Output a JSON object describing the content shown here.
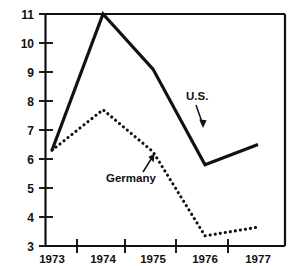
{
  "chart_data": {
    "type": "line",
    "title": "",
    "subtitle": "",
    "xlabel": "",
    "ylabel": "",
    "xlim": [
      1972.5,
      1977.5
    ],
    "ylim": [
      3,
      11
    ],
    "grid": false,
    "legend_position": "inline-annotations",
    "x": [
      1973,
      1974,
      1975,
      1976,
      1977
    ],
    "categories": [
      "1973",
      "1974",
      "1975",
      "1976",
      "1977"
    ],
    "y_ticks": [
      3,
      4,
      5,
      6,
      7,
      8,
      9,
      10,
      11
    ],
    "y_tick_labels": [
      "3",
      "4",
      "5",
      "6",
      "7",
      "8",
      "9",
      "10",
      "11"
    ],
    "x_tick_labels": [
      "1973",
      "1974",
      "1975",
      "1976",
      "1977"
    ],
    "series": [
      {
        "name": "U.S.",
        "style": "solid",
        "color": "#111111",
        "values": [
          6.3,
          11.0,
          9.1,
          5.8,
          6.5
        ]
      },
      {
        "name": "Germany",
        "style": "dotted",
        "color": "#111111",
        "values": [
          6.3,
          7.7,
          6.25,
          3.35,
          3.65
        ]
      }
    ],
    "annotations": [
      {
        "text": "U.S.",
        "points_to_series": "U.S."
      },
      {
        "text": "Germany",
        "points_to_series": "Germany"
      }
    ]
  },
  "axis": {
    "y_labels": [
      "11",
      "10",
      "9",
      "8",
      "7",
      "6",
      "5",
      "4",
      "3"
    ],
    "x_labels": [
      "1973",
      "1974",
      "1975",
      "1976",
      "1977"
    ]
  },
  "annotations": {
    "us_label": "U.S.",
    "germany_label": "Germany"
  },
  "colors": {
    "ink": "#111111",
    "background": "#ffffff"
  }
}
